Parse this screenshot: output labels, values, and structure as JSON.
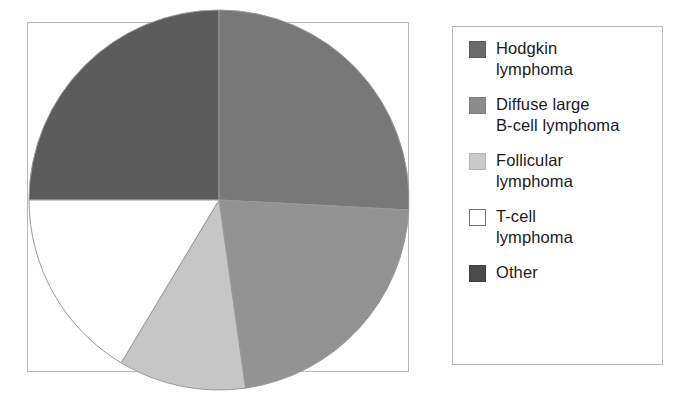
{
  "figure": {
    "type": "pie-chart-with-legend",
    "background_color": "#ffffff",
    "panel_border_color": "#b9b9b9"
  },
  "chart_data": {
    "type": "pie",
    "title": "",
    "subtitle": "",
    "xlabel": "",
    "ylabel": "",
    "legend_position": "right",
    "grid": false,
    "start_angle_deg": 0,
    "direction": "clockwise",
    "categories": [
      "Hodgkin lymphoma",
      "Diffuse large B-cell lymphoma",
      "Follicular lymphoma",
      "T-cell lymphoma",
      "Other"
    ],
    "values": [
      25,
      26,
      11,
      16,
      22
    ],
    "value_unit": "percent",
    "colors": [
      "#5c5c5c",
      "#787878",
      "#c6c6c6",
      "#ffffff",
      "#939393"
    ],
    "slices": [
      {
        "label": "Hodgkin lymphoma",
        "value": 25,
        "color": "#5c5c5c",
        "start_angle_deg": 270,
        "end_angle_deg": 360
      },
      {
        "label": "Diffuse large B-cell lymphoma",
        "value": 26,
        "color": "#787878",
        "start_angle_deg": 0,
        "end_angle_deg": 93
      },
      {
        "label": "Other",
        "value": 22,
        "color": "#939393",
        "start_angle_deg": 93,
        "end_angle_deg": 172
      },
      {
        "label": "Follicular lymphoma",
        "value": 11,
        "color": "#c6c6c6",
        "start_angle_deg": 172,
        "end_angle_deg": 211
      },
      {
        "label": "T-cell lymphoma",
        "value": 16,
        "color": "#ffffff",
        "start_angle_deg": 211,
        "end_angle_deg": 270
      }
    ],
    "slice_edge_color": "#9a9a9a"
  },
  "legend": {
    "items": [
      {
        "label": "Hodgkin\nlymphoma",
        "swatch_color": "#6b6b6b",
        "swatch_border": "#5c5c5c",
        "icon": "legend-swatch-icon"
      },
      {
        "label": "Diffuse large\nB-cell lymphoma",
        "swatch_color": "#8c8c8c",
        "swatch_border": "#7d7d7d",
        "icon": "legend-swatch-icon"
      },
      {
        "label": "Follicular\nlymphoma",
        "swatch_color": "#cacaca",
        "swatch_border": "#b5b5b5",
        "icon": "legend-swatch-icon"
      },
      {
        "label": "T-cell\nlymphoma",
        "swatch_color": "#ffffff",
        "swatch_border": "#707070",
        "icon": "legend-swatch-icon"
      },
      {
        "label": "Other",
        "swatch_color": "#4b4b4b",
        "swatch_border": "#3d3d3d",
        "icon": "legend-swatch-icon"
      }
    ]
  }
}
